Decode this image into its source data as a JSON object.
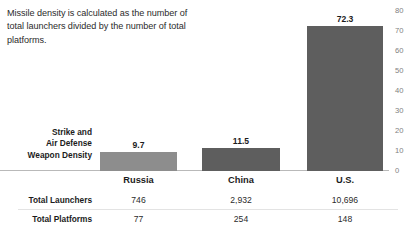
{
  "annotation": {
    "text": "Missile density is calculated as the number of total launchers divided by the number of total platforms."
  },
  "row_labels": {
    "density": "Strike and\nAir Defense\nWeapon Density",
    "launchers": "Total Launchers",
    "platforms": "Total Platforms"
  },
  "colors": {
    "bar_russia": "#8d8d8d",
    "bar_china": "#5e5e5e",
    "bar_us": "#5e5e5e",
    "baseline": "#b9b9b9",
    "row_divider": "#e3e3e3",
    "text_primary": "#1c1c1c",
    "text_secondary": "#2b2b2b",
    "tick_text": "#808080",
    "background": "#ffffff"
  },
  "chart_data": {
    "type": "bar",
    "title": "",
    "xlabel": "",
    "ylabel": "",
    "categories": [
      "Russia",
      "China",
      "U.S."
    ],
    "values": [
      9.7,
      11.5,
      72.3
    ],
    "value_labels": [
      "9.7",
      "11.5",
      "72.3"
    ],
    "ylim": [
      0,
      80
    ],
    "yticks": [
      0,
      10,
      20,
      30,
      40,
      50,
      60,
      70,
      80
    ],
    "ytick_labels": [
      "0",
      "10",
      "20",
      "30",
      "40",
      "50",
      "60",
      "70",
      "80"
    ],
    "grid": false,
    "legend": null,
    "series": [
      {
        "name": "Strike and Air Defense Weapon Density",
        "values": [
          9.7,
          11.5,
          72.3
        ]
      }
    ],
    "table_rows": [
      {
        "header": "Total Launchers",
        "values": [
          "746",
          "2,932",
          "10,696"
        ]
      },
      {
        "header": "Total Platforms",
        "values": [
          "77",
          "254",
          "148"
        ]
      }
    ]
  }
}
